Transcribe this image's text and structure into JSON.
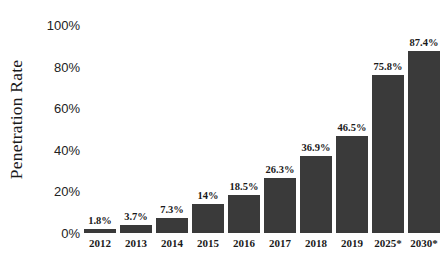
{
  "chart_data": {
    "type": "bar",
    "title": "",
    "subtitle": "",
    "xlabel": "",
    "ylabel": "Penetration Rate",
    "categories": [
      "2012",
      "2013",
      "2014",
      "2015",
      "2016",
      "2017",
      "2018",
      "2019",
      "2025*",
      "2030*"
    ],
    "values": [
      1.8,
      3.7,
      7.3,
      14,
      18.5,
      26.3,
      36.9,
      46.5,
      75.8,
      87.4
    ],
    "data_labels": [
      "1.8%",
      "3.7%",
      "7.3%",
      "14%",
      "18.5%",
      "26.3%",
      "36.9%",
      "46.5%",
      "75.8%",
      "87.4%"
    ],
    "ylim": [
      0,
      100
    ],
    "ytick_values": [
      0,
      20,
      40,
      60,
      80,
      100
    ],
    "ytick_labels": [
      "0%",
      "20%",
      "40%",
      "60%",
      "80%",
      "100%"
    ],
    "grid": false,
    "legend": null,
    "legend_position": "none",
    "series": [
      {
        "name": "Penetration Rate",
        "values": [
          1.8,
          3.7,
          7.3,
          14,
          18.5,
          26.3,
          36.9,
          46.5,
          75.8,
          87.4
        ]
      }
    ],
    "annotations": [
      "* denotes projected value"
    ],
    "colors": {
      "bar": "#3a3a3a",
      "background": "#ffffff",
      "text": "#1a1a1a",
      "tick_text": "#222222"
    }
  }
}
